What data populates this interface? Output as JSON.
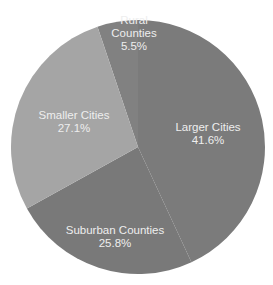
{
  "chart_data": {
    "type": "pie",
    "title": "",
    "center": [
      138,
      147
    ],
    "radius": 127,
    "slices": [
      {
        "name": "Rural Counties",
        "label_lines": [
          "Rural",
          "Counties"
        ],
        "value": 5.5,
        "value_label": "5.5%",
        "color": "#818181",
        "start_deg": -18.6,
        "end_deg": 0,
        "label_pos": [
          134,
          33
        ]
      },
      {
        "name": "Larger Cities",
        "label_lines": [
          "Larger Cities"
        ],
        "value": 41.6,
        "value_label": "41.6%",
        "color": "#7b7b7b",
        "start_deg": 0,
        "end_deg": 155.1,
        "label_pos": [
          208,
          134
        ]
      },
      {
        "name": "Suburban Counties",
        "label_lines": [
          "Suburban Counties"
        ],
        "value": 25.8,
        "value_label": "25.8%",
        "color": "#797979",
        "start_deg": 155.1,
        "end_deg": 241,
        "label_pos": [
          115,
          237
        ]
      },
      {
        "name": "Smaller Cities",
        "label_lines": [
          "Smaller Cities"
        ],
        "value": 27.1,
        "value_label": "27.1%",
        "color": "#a5a5a5",
        "start_deg": 241,
        "end_deg": 341.4,
        "label_pos": [
          74,
          122
        ]
      }
    ],
    "legend": "none",
    "background": "#ffffff",
    "label_color": "#eeeeee"
  }
}
